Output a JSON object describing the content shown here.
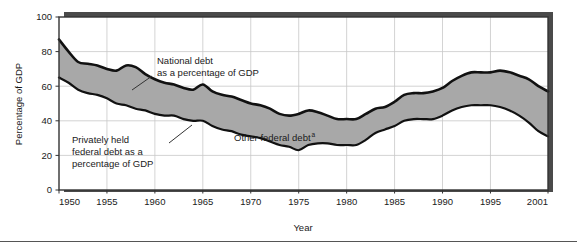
{
  "figure": {
    "background_color": "#ffffff",
    "rule_color": "#555555"
  },
  "chart_data": {
    "type": "area",
    "title": "",
    "subtitle": "",
    "xlabel": "Year",
    "ylabel": "Percentage of GDP",
    "xlim": [
      1950,
      2001
    ],
    "ylim": [
      0,
      100
    ],
    "grid": true,
    "grid_color": "#c8c8c8",
    "legend_position": "inline-annotations",
    "band_fill_color": "#a8a8a8",
    "line_color": "#111111",
    "plot_frame_color": "#333333",
    "shadow_color": "#4a4a4a",
    "x_ticks": [
      1950,
      1955,
      1960,
      1965,
      1970,
      1975,
      1980,
      1985,
      1990,
      1995,
      2001
    ],
    "x_tick_labels": [
      "1950",
      "1955",
      "1960",
      "1965",
      "1970",
      "1975",
      "1980",
      "1985",
      "1990",
      "1995",
      "2001"
    ],
    "y_ticks": [
      0,
      20,
      40,
      60,
      80,
      100
    ],
    "y_tick_labels": [
      "0",
      "20",
      "40",
      "60",
      "80",
      "100"
    ],
    "x": [
      1950,
      1951,
      1952,
      1953,
      1954,
      1955,
      1956,
      1957,
      1958,
      1959,
      1960,
      1961,
      1962,
      1963,
      1964,
      1965,
      1966,
      1967,
      1968,
      1969,
      1970,
      1971,
      1972,
      1973,
      1974,
      1975,
      1976,
      1977,
      1978,
      1979,
      1980,
      1981,
      1982,
      1983,
      1984,
      1985,
      1986,
      1987,
      1988,
      1989,
      1990,
      1991,
      1992,
      1993,
      1994,
      1995,
      1996,
      1997,
      1998,
      1999,
      2000,
      2001
    ],
    "series": [
      {
        "name": "National debt as a percentage of GDP",
        "values": [
          87,
          80,
          74,
          73,
          72,
          70,
          69,
          72,
          71,
          67,
          64,
          62,
          61,
          59,
          58,
          61,
          57,
          55,
          54,
          52,
          50,
          49,
          47,
          44,
          43,
          44,
          46,
          45,
          43,
          41,
          41,
          41,
          44,
          47,
          48,
          51,
          55,
          56,
          56,
          57,
          59,
          63,
          66,
          68,
          68,
          68,
          69,
          68,
          66,
          64,
          60,
          57
        ]
      },
      {
        "name": "Privately held federal debt as a percentage of GDP",
        "values": [
          65,
          62,
          58,
          56,
          55,
          53,
          50,
          49,
          47,
          46,
          44,
          43,
          43,
          41,
          40,
          40,
          37,
          35,
          34,
          32,
          31,
          30,
          28,
          26,
          25,
          23,
          26,
          27,
          27,
          26,
          26,
          26,
          29,
          33,
          35,
          37,
          40,
          41,
          41,
          41,
          43,
          46,
          48,
          49,
          49,
          49,
          48,
          46,
          43,
          39,
          34,
          31
        ]
      }
    ],
    "annotations": [
      {
        "id": "national-debt-annotation",
        "line1": "National debt",
        "line2": "as a percentage of GDP",
        "text_x": 157,
        "text_y": 64,
        "leader_x1": 152,
        "leader_y1": 76,
        "leader_x2": 132,
        "leader_y2": 90
      },
      {
        "id": "privately-held-debt-annotation",
        "line1": "Privately held",
        "line2": "federal debt as a",
        "line3": "percentage of GDP",
        "text_x": 72,
        "text_y": 143,
        "leader_x1": 169,
        "leader_y1": 143,
        "leader_x2": 192,
        "leader_y2": 125
      },
      {
        "id": "other-federal-debt-annotation",
        "text": "Other federal debt",
        "superscript": "a",
        "text_x": 234,
        "text_y": 141
      }
    ]
  }
}
